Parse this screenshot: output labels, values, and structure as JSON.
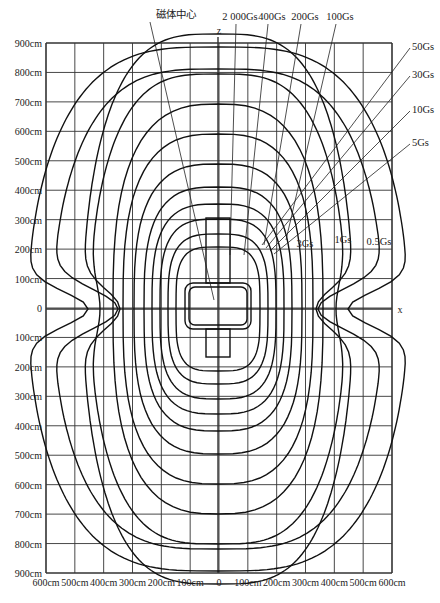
{
  "diagram": {
    "title_label": "磁体中心",
    "axis_labels": {
      "z": "z",
      "x": "x"
    },
    "y_ticks": [
      "900cm",
      "800cm",
      "700cm",
      "600cm",
      "500cm",
      "400cm",
      "300cm",
      "200cm",
      "100cm",
      "0",
      "100cm",
      "200cm",
      "300cm",
      "400cm",
      "500cm",
      "600cm",
      "700cm",
      "800cm",
      "900cm"
    ],
    "x_ticks": [
      "600cm",
      "500cm",
      "400cm",
      "300cm",
      "200cm",
      "100cm",
      "0",
      "100cm",
      "200cm",
      "300cm",
      "400cm",
      "500cm",
      "600cm"
    ],
    "top_labels": [
      "2 000Gs",
      "400Gs",
      "200Gs",
      "100Gs"
    ],
    "right_labels": [
      "50Gs",
      "30Gs",
      "10Gs",
      "5Gs"
    ],
    "inline_labels": [
      "3Gs",
      "1Gs",
      "0.5Gs"
    ],
    "contour_levels_gauss": [
      2000,
      400,
      200,
      100,
      50,
      30,
      10,
      5,
      3,
      1,
      0.5
    ]
  }
}
